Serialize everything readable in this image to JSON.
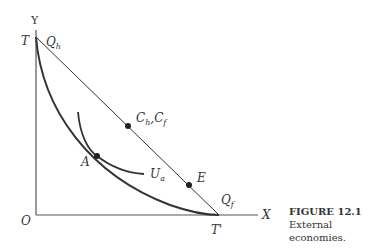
{
  "figure": {
    "number": "FIGURE 12.1",
    "caption": "External economies."
  },
  "axes": {
    "y_label": "Y",
    "x_label": "X",
    "origin_label": "O"
  },
  "labels": {
    "T": "T",
    "T_prime": "T'",
    "Q_h": "Q",
    "Q_h_sub": "h",
    "Q_f": "Q",
    "Q_f_sub": "f",
    "C": "C",
    "C_h_sub": "h",
    "C_sep": ",C",
    "C_f_sub": "f",
    "E": "E",
    "A": "A",
    "U": "U",
    "U_sub": "a"
  },
  "colors": {
    "line": "#333333",
    "axis": "#555555"
  }
}
